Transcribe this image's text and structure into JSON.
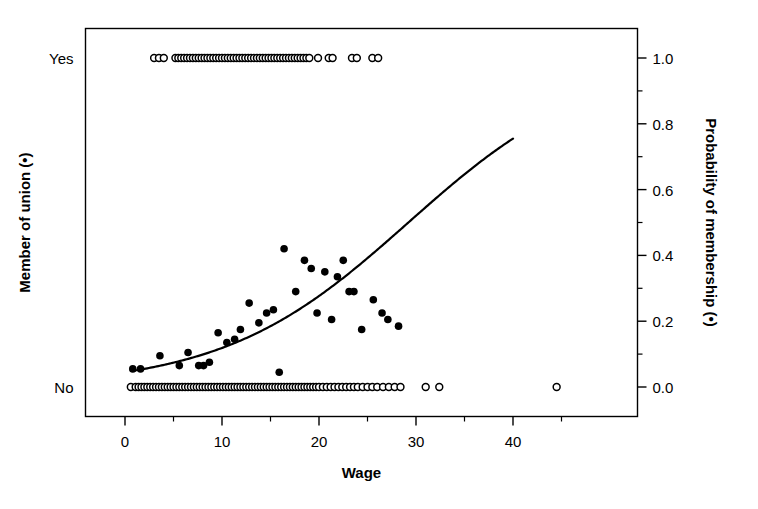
{
  "chart_data": {
    "type": "scatter",
    "title": "",
    "xlabel": "Wage",
    "ylabel_left": "Member of union (•)",
    "ylabel_right": "Probability of membership (•)",
    "xlim": [
      -4.2,
      47.5
    ],
    "ylim": [
      -0.09,
      1.09
    ],
    "grid": false,
    "legend": "none",
    "x_ticks": [
      0,
      10,
      20,
      30,
      40
    ],
    "x_tick_labels": [
      "0",
      "10",
      "20",
      "30",
      "40"
    ],
    "x_minor_ticks": [
      5,
      15,
      25,
      35,
      45
    ],
    "y_ticks_right": [
      0.0,
      0.2,
      0.4,
      0.6,
      0.8,
      1.0
    ],
    "y_tick_labels_right": [
      "0.0",
      "0.2",
      "0.4",
      "0.6",
      "0.8",
      "1.0"
    ],
    "y_minor_ticks_right": [
      0.1,
      0.3,
      0.5,
      0.7,
      0.9
    ],
    "y_ticks_left": [
      0.0,
      1.0
    ],
    "y_tick_labels_left": [
      "No",
      "Yes"
    ],
    "series": [
      {
        "name": "Observed outcomes (union member = Yes)",
        "marker": "open-circle",
        "marker_size": 5,
        "color": "#000000",
        "points": [
          [
            3.0,
            1
          ],
          [
            3.5,
            1
          ],
          [
            4.0,
            1
          ],
          [
            5.2,
            1
          ],
          [
            5.5,
            1
          ],
          [
            5.8,
            1
          ],
          [
            6.1,
            1
          ],
          [
            6.4,
            1
          ],
          [
            6.7,
            1
          ],
          [
            7.0,
            1
          ],
          [
            7.3,
            1
          ],
          [
            7.6,
            1
          ],
          [
            7.9,
            1
          ],
          [
            8.2,
            1
          ],
          [
            8.5,
            1
          ],
          [
            8.8,
            1
          ],
          [
            9.1,
            1
          ],
          [
            9.4,
            1
          ],
          [
            9.7,
            1
          ],
          [
            10.0,
            1
          ],
          [
            10.3,
            1
          ],
          [
            10.6,
            1
          ],
          [
            10.9,
            1
          ],
          [
            11.2,
            1
          ],
          [
            11.5,
            1
          ],
          [
            11.8,
            1
          ],
          [
            12.1,
            1
          ],
          [
            12.4,
            1
          ],
          [
            12.7,
            1
          ],
          [
            13.0,
            1
          ],
          [
            13.3,
            1
          ],
          [
            13.6,
            1
          ],
          [
            13.9,
            1
          ],
          [
            14.2,
            1
          ],
          [
            14.5,
            1
          ],
          [
            14.8,
            1
          ],
          [
            15.1,
            1
          ],
          [
            15.4,
            1
          ],
          [
            15.7,
            1
          ],
          [
            16.0,
            1
          ],
          [
            16.3,
            1
          ],
          [
            16.6,
            1
          ],
          [
            16.9,
            1
          ],
          [
            17.2,
            1
          ],
          [
            17.5,
            1
          ],
          [
            17.8,
            1
          ],
          [
            18.1,
            1
          ],
          [
            18.4,
            1
          ],
          [
            18.7,
            1
          ],
          [
            19.0,
            1
          ],
          [
            19.9,
            1
          ],
          [
            21.0,
            1
          ],
          [
            21.4,
            1
          ],
          [
            23.4,
            1
          ],
          [
            23.9,
            1
          ],
          [
            25.5,
            1
          ],
          [
            26.1,
            1
          ]
        ]
      },
      {
        "name": "Observed outcomes (union member = No)",
        "marker": "open-circle",
        "marker_size": 5,
        "color": "#000000",
        "points": [
          [
            0.6,
            0
          ],
          [
            1.1,
            0
          ],
          [
            1.4,
            0
          ],
          [
            1.7,
            0
          ],
          [
            2.0,
            0
          ],
          [
            2.3,
            0
          ],
          [
            2.6,
            0
          ],
          [
            2.9,
            0
          ],
          [
            3.2,
            0
          ],
          [
            3.5,
            0
          ],
          [
            3.8,
            0
          ],
          [
            4.1,
            0
          ],
          [
            4.4,
            0
          ],
          [
            4.7,
            0
          ],
          [
            5.0,
            0
          ],
          [
            5.3,
            0
          ],
          [
            5.6,
            0
          ],
          [
            5.9,
            0
          ],
          [
            6.2,
            0
          ],
          [
            6.5,
            0
          ],
          [
            6.8,
            0
          ],
          [
            7.1,
            0
          ],
          [
            7.4,
            0
          ],
          [
            7.7,
            0
          ],
          [
            8.0,
            0
          ],
          [
            8.3,
            0
          ],
          [
            8.6,
            0
          ],
          [
            8.9,
            0
          ],
          [
            9.2,
            0
          ],
          [
            9.5,
            0
          ],
          [
            9.8,
            0
          ],
          [
            10.1,
            0
          ],
          [
            10.4,
            0
          ],
          [
            10.7,
            0
          ],
          [
            11.0,
            0
          ],
          [
            11.3,
            0
          ],
          [
            11.6,
            0
          ],
          [
            11.9,
            0
          ],
          [
            12.2,
            0
          ],
          [
            12.5,
            0
          ],
          [
            12.8,
            0
          ],
          [
            13.1,
            0
          ],
          [
            13.4,
            0
          ],
          [
            13.7,
            0
          ],
          [
            14.0,
            0
          ],
          [
            14.3,
            0
          ],
          [
            14.6,
            0
          ],
          [
            14.9,
            0
          ],
          [
            15.2,
            0
          ],
          [
            15.5,
            0
          ],
          [
            15.8,
            0
          ],
          [
            16.1,
            0
          ],
          [
            16.4,
            0
          ],
          [
            16.7,
            0
          ],
          [
            17.0,
            0
          ],
          [
            17.3,
            0
          ],
          [
            17.6,
            0
          ],
          [
            17.9,
            0
          ],
          [
            18.2,
            0
          ],
          [
            18.5,
            0
          ],
          [
            18.8,
            0
          ],
          [
            19.1,
            0
          ],
          [
            19.4,
            0
          ],
          [
            19.7,
            0
          ],
          [
            20.0,
            0
          ],
          [
            20.4,
            0
          ],
          [
            20.8,
            0
          ],
          [
            21.2,
            0
          ],
          [
            21.6,
            0
          ],
          [
            22.0,
            0
          ],
          [
            22.4,
            0
          ],
          [
            22.8,
            0
          ],
          [
            23.2,
            0
          ],
          [
            23.6,
            0
          ],
          [
            24.0,
            0
          ],
          [
            24.5,
            0
          ],
          [
            25.0,
            0
          ],
          [
            25.5,
            0
          ],
          [
            26.0,
            0
          ],
          [
            26.6,
            0
          ],
          [
            27.2,
            0
          ],
          [
            27.8,
            0
          ],
          [
            28.4,
            0
          ],
          [
            31.0,
            0
          ],
          [
            32.4,
            0
          ],
          [
            44.5,
            0
          ]
        ]
      },
      {
        "name": "Binned empirical proportions",
        "marker": "filled-circle",
        "marker_size": 5.5,
        "color": "#000000",
        "points": [
          [
            0.8,
            0.055
          ],
          [
            1.6,
            0.055
          ],
          [
            3.6,
            0.095
          ],
          [
            5.6,
            0.065
          ],
          [
            6.5,
            0.105
          ],
          [
            7.6,
            0.065
          ],
          [
            8.1,
            0.065
          ],
          [
            8.7,
            0.075
          ],
          [
            9.6,
            0.165
          ],
          [
            10.5,
            0.135
          ],
          [
            11.3,
            0.145
          ],
          [
            11.9,
            0.175
          ],
          [
            12.8,
            0.255
          ],
          [
            13.8,
            0.195
          ],
          [
            14.6,
            0.225
          ],
          [
            15.3,
            0.235
          ],
          [
            15.9,
            0.045
          ],
          [
            16.4,
            0.42
          ],
          [
            17.6,
            0.29
          ],
          [
            18.5,
            0.385
          ],
          [
            19.2,
            0.36
          ],
          [
            19.8,
            0.225
          ],
          [
            20.6,
            0.35
          ],
          [
            21.3,
            0.205
          ],
          [
            21.9,
            0.335
          ],
          [
            22.5,
            0.385
          ],
          [
            23.1,
            0.29
          ],
          [
            23.6,
            0.29
          ],
          [
            24.4,
            0.175
          ],
          [
            25.6,
            0.265
          ],
          [
            26.5,
            0.225
          ],
          [
            27.1,
            0.205
          ],
          [
            28.2,
            0.185
          ]
        ]
      }
    ],
    "fit_curve": {
      "name": "Fitted logistic regression curve",
      "color": "#000000",
      "line_width": 2.2,
      "x_range": [
        1.0,
        40.0
      ],
      "model": "logistic",
      "intercept": -3.05,
      "slope": 0.0655,
      "endpoints": [
        [
          1.0,
          0.05
        ],
        [
          40.0,
          0.755
        ]
      ]
    }
  }
}
